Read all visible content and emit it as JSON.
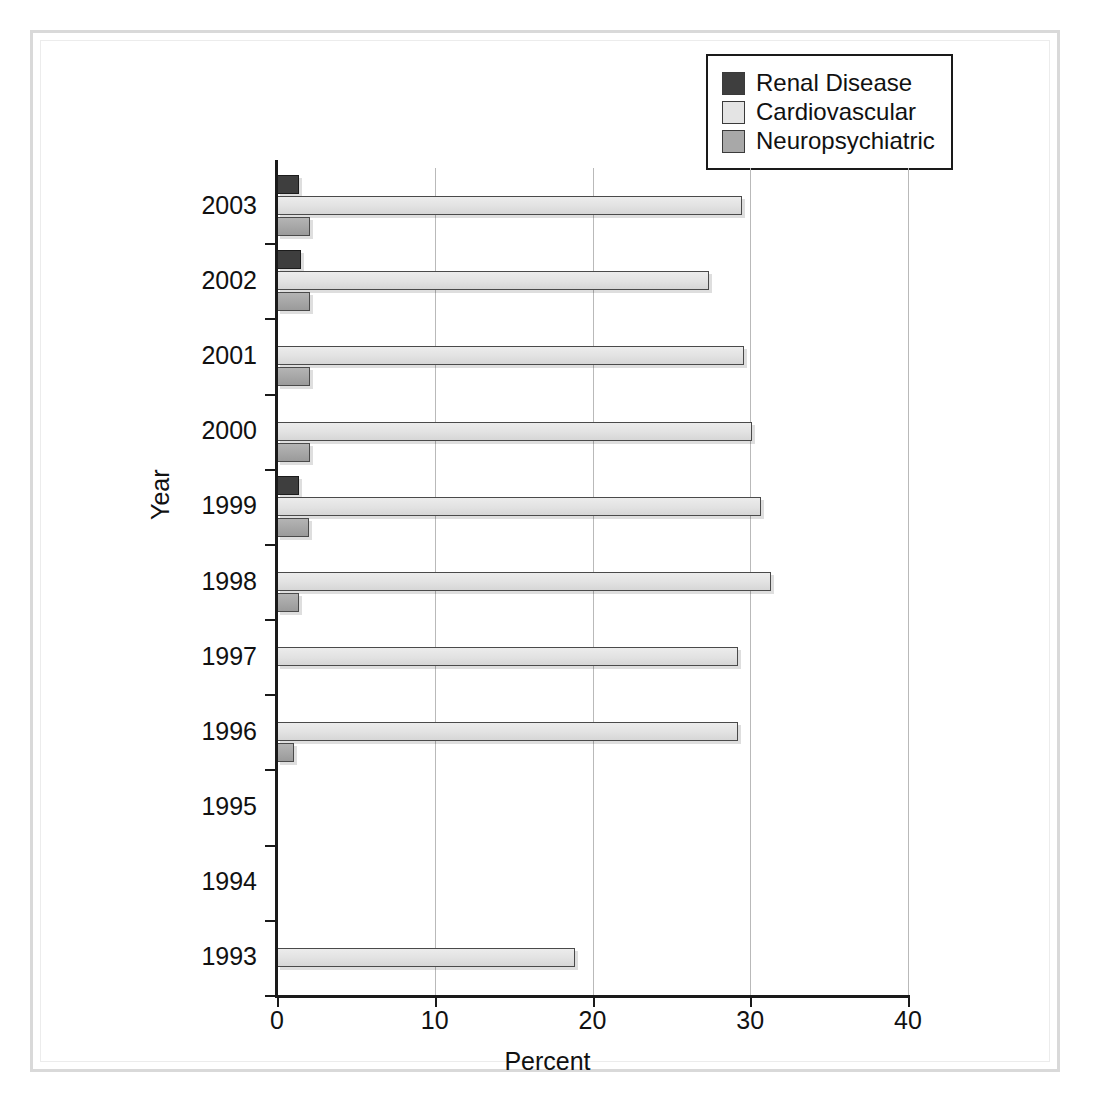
{
  "chart_data": {
    "type": "bar",
    "orientation": "horizontal",
    "title": "",
    "xlabel": "Percent",
    "ylabel": "Year",
    "xlim": [
      0,
      40
    ],
    "xticks": [
      0,
      10,
      20,
      30,
      40
    ],
    "xtick_labels": [
      "0",
      "10",
      "20",
      "30",
      "40"
    ],
    "grid": "vertical",
    "categories": [
      "2003",
      "2002",
      "2001",
      "2000",
      "1999",
      "1998",
      "1997",
      "1996",
      "1995",
      "1994",
      "1993"
    ],
    "legend_position": "top-right",
    "series": [
      {
        "name": "Renal Disease",
        "color": "#3e3e3e",
        "values": [
          1.4,
          1.5,
          null,
          null,
          1.4,
          null,
          null,
          null,
          null,
          null,
          null
        ]
      },
      {
        "name": "Cardiovascular",
        "color": "#e4e4e4",
        "values": [
          29.5,
          27.4,
          29.6,
          30.1,
          30.7,
          31.3,
          29.2,
          29.2,
          null,
          null,
          18.9
        ]
      },
      {
        "name": "Neuropsychiatric",
        "color": "#a8a8a8",
        "values": [
          2.1,
          2.1,
          2.1,
          2.1,
          2.0,
          1.4,
          null,
          1.1,
          null,
          null,
          null
        ]
      }
    ]
  },
  "legend": {
    "items": [
      {
        "label": "Renal Disease",
        "swatch": "renal"
      },
      {
        "label": "Cardiovascular",
        "swatch": "cardio"
      },
      {
        "label": "Neuropsychiatric",
        "swatch": "neuro"
      }
    ]
  },
  "colors": {
    "renal": "#3e3e3e",
    "cardiovascular": "#e4e4e4",
    "neuropsychiatric": "#a8a8a8",
    "axis": "#1a1a1a",
    "gridline": "#b9b9b9",
    "frame": "#d9d9d9"
  }
}
